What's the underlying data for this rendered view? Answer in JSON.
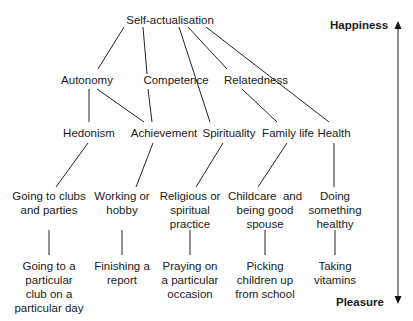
{
  "diagram": {
    "axis": {
      "top_label": "Happiness",
      "bottom_label": "Pleasure"
    },
    "level0": {
      "root": "Self-actualisation"
    },
    "level1": [
      "Autonomy",
      "Competence",
      "Relatedness"
    ],
    "level2": [
      "Hedonism",
      "Achievement",
      "Spirituality",
      "Family life",
      "Health"
    ],
    "level3": [
      [
        "Going to clubs",
        "and parties"
      ],
      [
        "Working or",
        "hobby"
      ],
      [
        "Religious or",
        "spiritual",
        "practice"
      ],
      [
        "Childcare  and",
        "being good",
        "spouse"
      ],
      [
        "Doing",
        "something",
        "healthy"
      ]
    ],
    "level4": [
      [
        "Going to a",
        "particular",
        "club on a",
        "particular day"
      ],
      [
        "Finishing a",
        "report"
      ],
      [
        "Praying on",
        "a particular",
        "occasion"
      ],
      [
        "Picking",
        "children up",
        "from school"
      ],
      [
        "Taking",
        "vitamins"
      ]
    ],
    "edges": [
      [
        "Self-actualisation",
        "Autonomy"
      ],
      [
        "Self-actualisation",
        "Competence"
      ],
      [
        "Self-actualisation",
        "Spirituality"
      ],
      [
        "Self-actualisation",
        "Relatedness"
      ],
      [
        "Self-actualisation",
        "Health"
      ],
      [
        "Autonomy",
        "Hedonism"
      ],
      [
        "Autonomy",
        "Achievement"
      ],
      [
        "Competence",
        "Achievement"
      ],
      [
        "Relatedness",
        "Family life"
      ],
      [
        "Hedonism",
        "Going to clubs and parties"
      ],
      [
        "Achievement",
        "Working or hobby"
      ],
      [
        "Spirituality",
        "Religious or spiritual practice"
      ],
      [
        "Family life",
        "Childcare and being good spouse"
      ],
      [
        "Health",
        "Doing something healthy"
      ],
      [
        "Going to clubs and parties",
        "Going to a particular club on a particular day"
      ],
      [
        "Working or hobby",
        "Finishing a report"
      ],
      [
        "Religious or spiritual practice",
        "Praying on a particular occasion"
      ],
      [
        "Childcare and being good spouse",
        "Picking children up from school"
      ],
      [
        "Doing something healthy",
        "Taking vitamins"
      ]
    ]
  }
}
